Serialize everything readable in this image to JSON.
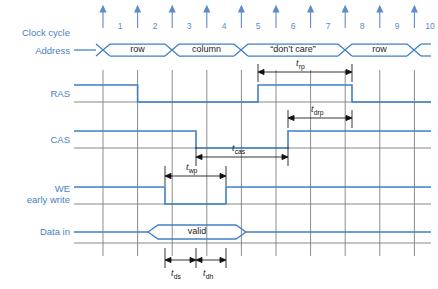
{
  "diagram": {
    "colors": {
      "signal": "#3f7fc4",
      "label": "#4a7fbf",
      "grid": "#6f6f6f",
      "text": "#1b1b1b",
      "background": "#ffffff"
    },
    "row_labels": [
      {
        "id": "clock-cycle",
        "label": "Clock cycle"
      },
      {
        "id": "address",
        "label": "Address"
      },
      {
        "id": "ras",
        "label": "RAS"
      },
      {
        "id": "cas",
        "label": "CAS"
      },
      {
        "id": "we",
        "label": "WE",
        "label2": "early write"
      },
      {
        "id": "data-in",
        "label": "Data in"
      }
    ],
    "clock_cycles": [
      "1",
      "2",
      "3",
      "4",
      "5",
      "6",
      "7",
      "8",
      "9",
      "10"
    ],
    "address_segments": [
      {
        "label": "row",
        "start": 1,
        "end": 3
      },
      {
        "label": "column",
        "start": 3,
        "end": 5
      },
      {
        "label": "“don’t care”",
        "start": 5,
        "end": 8
      },
      {
        "label": "row",
        "start": 8,
        "end": 10
      }
    ],
    "data_segments": [
      {
        "label": "valid",
        "start": 2.8,
        "end": 5.2
      }
    ],
    "signals": [
      {
        "name": "RAS",
        "initial": "high",
        "transitions": [
          {
            "at": 2,
            "to": "low"
          },
          {
            "at": 5.5,
            "to": "high"
          },
          {
            "at": 8.2,
            "to": "low"
          }
        ]
      },
      {
        "name": "CAS",
        "initial": "high",
        "transitions": [
          {
            "at": 3.7,
            "to": "low"
          },
          {
            "at": 6.4,
            "to": "high"
          }
        ]
      },
      {
        "name": "WE",
        "initial": "high",
        "transitions": [
          {
            "at": 2.9,
            "to": "low"
          },
          {
            "at": 4.6,
            "to": "high"
          }
        ]
      }
    ],
    "timing_markers": [
      {
        "id": "trp",
        "base": "t",
        "sub": "rp",
        "from": 5.5,
        "to": 8.2,
        "row": "above-ras"
      },
      {
        "id": "tdrp",
        "base": "t",
        "sub": "drp",
        "from": 6.4,
        "to": 8.2,
        "row": "above-cas"
      },
      {
        "id": "tcas",
        "base": "t",
        "sub": "cas",
        "from": 3.7,
        "to": 6.4,
        "row": "below-cas"
      },
      {
        "id": "twp",
        "base": "t",
        "sub": "wp",
        "from": 2.9,
        "to": 4.6,
        "row": "above-we"
      },
      {
        "id": "tds",
        "base": "t",
        "sub": "ds",
        "from": 2.9,
        "to": 3.7,
        "row": "below-data"
      },
      {
        "id": "tdh",
        "base": "t",
        "sub": "dh",
        "from": 3.7,
        "to": 4.6,
        "row": "below-data"
      }
    ]
  }
}
